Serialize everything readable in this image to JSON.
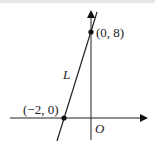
{
  "diagram": {
    "title": "",
    "line_label": "L",
    "origin_label": "O",
    "points": [
      {
        "label": "(0, 8)",
        "x": 0,
        "y": 8
      },
      {
        "label": "(−2, 0)",
        "x": -2,
        "y": 0
      }
    ]
  }
}
